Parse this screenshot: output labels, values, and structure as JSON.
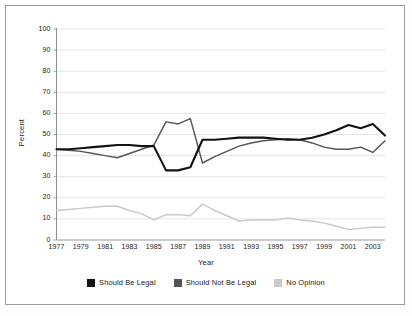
{
  "chart_data": {
    "type": "line",
    "title": "",
    "xlabel": "Year",
    "ylabel": "Percent",
    "ylim": [
      0,
      100
    ],
    "ytick_step": 10,
    "yticks": [
      100,
      90,
      80,
      70,
      60,
      50,
      40,
      30,
      20,
      10,
      0
    ],
    "xlim": [
      1977,
      2004
    ],
    "xticks": [
      1977,
      1979,
      1981,
      1983,
      1985,
      1987,
      1989,
      1991,
      1993,
      1995,
      1997,
      1999,
      2001,
      2003
    ],
    "grid": "horizontal",
    "legend_position": "bottom",
    "x": [
      1977,
      1978,
      1979,
      1980,
      1981,
      1982,
      1983,
      1984,
      1985,
      1986,
      1987,
      1988,
      1989,
      1990,
      1991,
      1992,
      1993,
      1994,
      1995,
      1996,
      1997,
      1998,
      1999,
      2000,
      2001,
      2002,
      2003,
      2004
    ],
    "series": [
      {
        "name": "Should Be Legal",
        "color": "#121212",
        "values": [
          43,
          43,
          43.5,
          44,
          44.5,
          45,
          45,
          44.5,
          44.5,
          33,
          33,
          34.5,
          47.5,
          47.5,
          48,
          48.5,
          48.5,
          48.5,
          48,
          47.5,
          47.5,
          48.5,
          50,
          52,
          54.5,
          53,
          55,
          49.5
        ]
      },
      {
        "name": "Should Not Be Legal",
        "color": "#555555",
        "values": [
          43,
          42.5,
          42,
          41,
          40,
          39,
          41,
          43,
          45,
          56,
          55,
          57.5,
          36.5,
          39.5,
          42,
          44.5,
          46,
          47,
          47.5,
          48,
          47.5,
          46,
          44,
          43,
          43,
          44,
          41.5,
          47
        ]
      },
      {
        "name": "No Opinion",
        "color": "#c9c9c9",
        "values": [
          14,
          14.5,
          15,
          15.5,
          16,
          16,
          14,
          12.5,
          9.5,
          12,
          12,
          11.5,
          17,
          14,
          11.5,
          9,
          9.5,
          9.5,
          9.5,
          10.5,
          9.5,
          9,
          8,
          6.5,
          5,
          5.5,
          6,
          6
        ]
      }
    ]
  },
  "legend": {
    "items": [
      {
        "label": "Should Be Legal",
        "color": "#121212"
      },
      {
        "label": "Should Not Be Legal",
        "color": "#555555"
      },
      {
        "label": "No Opinion",
        "color": "#c9c9c9"
      }
    ]
  },
  "axes": {
    "xlabel": "Year",
    "ylabel": "Percent"
  }
}
